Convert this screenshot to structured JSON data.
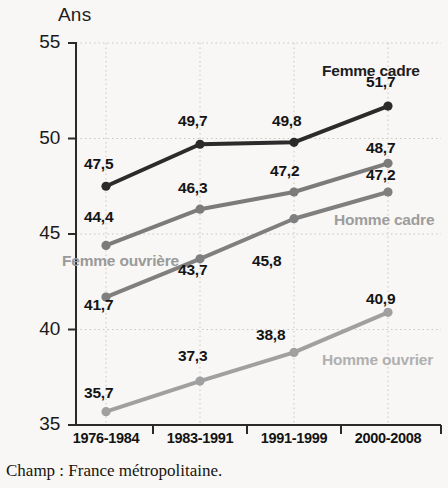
{
  "chart_data": {
    "type": "line",
    "title": "",
    "subtitle": "",
    "xlabel": "",
    "ylabel": "Ans",
    "ylim": [
      35,
      55
    ],
    "yticks": [
      35,
      40,
      45,
      50,
      55
    ],
    "ytick_labels": [
      "35",
      "40",
      "45",
      "50",
      "55"
    ],
    "grid": true,
    "grid_style": "dotted",
    "legend_position": "inline-annotations",
    "categories": [
      "1976-1984",
      "1983-1991",
      "1991-1999",
      "2000-2008"
    ],
    "series": [
      {
        "name": "Femme cadre",
        "color": "#2b2b2b",
        "label_color": "#1d1d1d",
        "values": [
          47.5,
          49.7,
          49.8,
          51.7
        ],
        "value_labels": [
          "47,5",
          "49,7",
          "49,8",
          "51,7"
        ]
      },
      {
        "name": "Homme cadre",
        "color": "#7b7b7b",
        "label_color": "#9d9d9d",
        "values": [
          44.4,
          46.3,
          47.2,
          48.7
        ],
        "value_labels": [
          "44,4",
          "46,3",
          "47,2",
          "48,7"
        ]
      },
      {
        "name": "Femme ouvrière",
        "color": "#7f7f7f",
        "label_color": "#9a9a9a",
        "values": [
          41.7,
          43.7,
          45.8,
          47.2
        ],
        "value_labels": [
          "41,7",
          "43,7",
          "45,8",
          "47,2"
        ]
      },
      {
        "name": "Homme ouvrier",
        "color": "#a0a0a0",
        "label_color": "#b0b0b0",
        "values": [
          35.7,
          37.3,
          38.8,
          40.9
        ],
        "value_labels": [
          "35,7",
          "37,3",
          "38,8",
          "40,9"
        ]
      }
    ]
  },
  "axis": {
    "unit_label": "Ans"
  },
  "series_annotations": [
    {
      "text": "Femme cadre",
      "x": 322,
      "y": 62,
      "color": "#1d1d1d"
    },
    {
      "text": "Homme cadre",
      "x": 334,
      "y": 211,
      "color": "#9d9d9d"
    },
    {
      "text": "Femme ouvrière",
      "x": 62,
      "y": 252,
      "color": "#9a9a9a"
    },
    {
      "text": "Homme ouvrier",
      "x": 322,
      "y": 351,
      "color": "#b0b0b0"
    }
  ],
  "value_labels": [
    {
      "text": "47,5",
      "x": 84,
      "y": 155
    },
    {
      "text": "49,7",
      "x": 178,
      "y": 112
    },
    {
      "text": "49,8",
      "x": 272,
      "y": 112
    },
    {
      "text": "51,7",
      "x": 366,
      "y": 73
    },
    {
      "text": "44,4",
      "x": 84,
      "y": 208
    },
    {
      "text": "46,3",
      "x": 178,
      "y": 179
    },
    {
      "text": "47,2",
      "x": 270,
      "y": 162
    },
    {
      "text": "48,7",
      "x": 366,
      "y": 139
    },
    {
      "text": "47,2",
      "x": 366,
      "y": 166
    },
    {
      "text": "41,7",
      "x": 84,
      "y": 296
    },
    {
      "text": "43,7",
      "x": 178,
      "y": 261
    },
    {
      "text": "45,8",
      "x": 252,
      "y": 252
    },
    {
      "text": "35,7",
      "x": 84,
      "y": 384
    },
    {
      "text": "37,3",
      "x": 178,
      "y": 347
    },
    {
      "text": "38,8",
      "x": 256,
      "y": 326
    },
    {
      "text": "40,9",
      "x": 366,
      "y": 290
    }
  ],
  "caption": {
    "text": "Champ : France métropolitaine."
  }
}
